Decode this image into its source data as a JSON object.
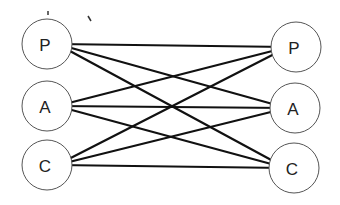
{
  "diagram": {
    "type": "bipartite-graph",
    "left_nodes": [
      {
        "id": "L-P",
        "label": "P",
        "cx": 47,
        "cy": 44
      },
      {
        "id": "L-A",
        "label": "A",
        "cx": 47,
        "cy": 106
      },
      {
        "id": "L-C",
        "label": "C",
        "cx": 47,
        "cy": 165
      }
    ],
    "right_nodes": [
      {
        "id": "R-P",
        "label": "P",
        "cx": 296,
        "cy": 47
      },
      {
        "id": "R-A",
        "label": "A",
        "cx": 295,
        "cy": 108
      },
      {
        "id": "R-C",
        "label": "C",
        "cx": 294,
        "cy": 168
      }
    ],
    "node_radius": 25,
    "edges": [
      [
        "L-P",
        "R-P"
      ],
      [
        "L-P",
        "R-A"
      ],
      [
        "L-P",
        "R-C"
      ],
      [
        "L-A",
        "R-P"
      ],
      [
        "L-A",
        "R-A"
      ],
      [
        "L-A",
        "R-C"
      ],
      [
        "L-C",
        "R-P"
      ],
      [
        "L-C",
        "R-A"
      ],
      [
        "L-C",
        "R-C"
      ]
    ],
    "colors": {
      "edge": "#111111",
      "circle_stroke": "#555555",
      "label": "#222222"
    }
  }
}
